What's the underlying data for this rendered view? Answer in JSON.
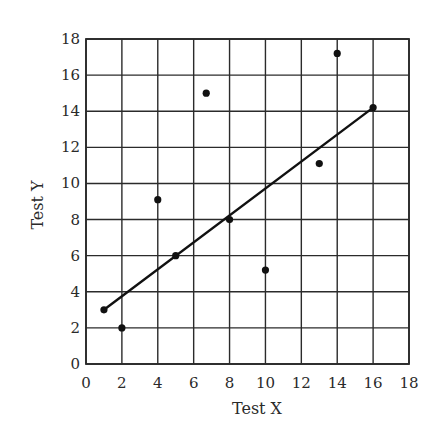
{
  "chart_data": {
    "type": "scatter",
    "title": "",
    "xlabel": "Test X",
    "ylabel": "Test Y",
    "xlim": [
      0,
      18
    ],
    "ylim": [
      0,
      18
    ],
    "grid": true,
    "legend": null,
    "x_ticks": [
      0,
      2,
      4,
      6,
      8,
      10,
      12,
      14,
      16,
      18
    ],
    "y_ticks": [
      0,
      2,
      4,
      6,
      8,
      10,
      12,
      14,
      16,
      18
    ],
    "series": [
      {
        "name": "observations",
        "type": "scatter",
        "points": [
          {
            "x": 1,
            "y": 3
          },
          {
            "x": 2,
            "y": 2
          },
          {
            "x": 4,
            "y": 9.1
          },
          {
            "x": 5,
            "y": 6
          },
          {
            "x": 6.7,
            "y": 15
          },
          {
            "x": 8,
            "y": 8
          },
          {
            "x": 10,
            "y": 5.2
          },
          {
            "x": 13,
            "y": 11.1
          },
          {
            "x": 14,
            "y": 17.2
          },
          {
            "x": 16,
            "y": 14.2
          }
        ]
      },
      {
        "name": "regression line",
        "type": "line",
        "points": [
          {
            "x": 1,
            "y": 3
          },
          {
            "x": 16,
            "y": 14.2
          }
        ]
      }
    ],
    "colors": {
      "background": "#ffffff",
      "grid": "#2b2b2b",
      "points": "#111111",
      "line": "#111111",
      "text": "#2a2a2a"
    }
  }
}
